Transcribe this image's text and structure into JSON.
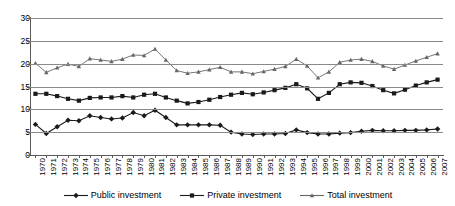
{
  "chart_data": {
    "type": "line",
    "title": "",
    "xlabel": "",
    "ylabel": "",
    "ylim": [
      0,
      30
    ],
    "yticks": [
      0,
      5,
      10,
      15,
      20,
      25,
      30
    ],
    "grid": true,
    "legend_position": "bottom",
    "x": [
      1970,
      1971,
      1972,
      1973,
      1974,
      1975,
      1976,
      1977,
      1978,
      1979,
      1980,
      1981,
      1982,
      1983,
      1984,
      1985,
      1986,
      1987,
      1988,
      1989,
      1990,
      1991,
      1992,
      1993,
      1994,
      1995,
      1996,
      1997,
      1998,
      1999,
      2000,
      2001,
      2002,
      2003,
      2004,
      2005,
      2006,
      2007
    ],
    "categories": [
      "1970",
      "1971",
      "1972",
      "1973",
      "1974",
      "1975",
      "1976",
      "1977",
      "1978",
      "1979",
      "1980",
      "1981",
      "1982",
      "1983",
      "1984",
      "1985",
      "1986",
      "1987",
      "1988",
      "1989",
      "1990",
      "1991",
      "1992",
      "1993",
      "1994",
      "1995",
      "1996",
      "1997",
      "1998",
      "1999",
      "2000",
      "2001",
      "2002",
      "2003",
      "2004",
      "2005",
      "2006",
      "2007"
    ],
    "series": [
      {
        "name": "Public investment",
        "marker": "diamond",
        "color": "#1a1a1a",
        "values": [
          6.7,
          4.7,
          6.2,
          7.6,
          7.5,
          8.6,
          8.2,
          7.9,
          8.1,
          9.3,
          8.6,
          9.8,
          8.2,
          6.6,
          6.6,
          6.6,
          6.6,
          6.5,
          5.0,
          4.6,
          4.5,
          4.6,
          4.6,
          4.7,
          5.5,
          4.9,
          4.6,
          4.6,
          4.8,
          4.9,
          5.2,
          5.4,
          5.3,
          5.3,
          5.4,
          5.4,
          5.5,
          5.7
        ]
      },
      {
        "name": "Private investment",
        "marker": "square",
        "color": "#1a1a1a",
        "values": [
          13.4,
          13.4,
          12.9,
          12.3,
          11.9,
          12.5,
          12.6,
          12.6,
          12.9,
          12.6,
          13.2,
          13.4,
          12.6,
          11.9,
          11.3,
          11.6,
          12.1,
          12.7,
          13.2,
          13.6,
          13.3,
          13.7,
          14.2,
          14.7,
          15.5,
          14.6,
          12.3,
          13.6,
          15.5,
          15.9,
          15.8,
          15.1,
          14.2,
          13.5,
          14.3,
          15.2,
          15.9,
          16.5
        ]
      },
      {
        "name": "Total investment",
        "marker": "triangle",
        "color": "#666666",
        "values": [
          20.1,
          18.1,
          19.1,
          19.9,
          19.4,
          21.1,
          20.8,
          20.5,
          21.0,
          21.9,
          21.8,
          23.2,
          20.8,
          18.5,
          17.9,
          18.2,
          18.7,
          19.2,
          18.2,
          18.2,
          17.8,
          18.3,
          18.8,
          19.4,
          21.0,
          19.5,
          16.9,
          18.2,
          20.3,
          20.8,
          21.0,
          20.5,
          19.5,
          18.8,
          19.7,
          20.6,
          21.4,
          22.2
        ]
      }
    ]
  }
}
